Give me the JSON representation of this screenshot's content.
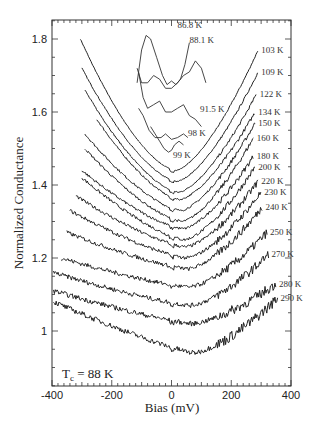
{
  "chart_data": {
    "type": "line",
    "title": "",
    "xlabel": "Bias (mV)",
    "ylabel": "Normalized Conductance",
    "xlim": [
      -400,
      400
    ],
    "ylim": [
      0.85,
      1.85
    ],
    "xticks": [
      -400,
      -200,
      0,
      200,
      400
    ],
    "xtick_labels": [
      "-400",
      "-200",
      "0",
      "200",
      "400"
    ],
    "yticks": [
      1.0,
      1.2,
      1.4,
      1.6,
      1.8
    ],
    "ytick_labels": [
      "1",
      "1.2",
      "1.4",
      "1.6",
      "1.8"
    ],
    "grid": false,
    "annotation": {
      "prefix": "T",
      "subscript": "c",
      "suffix": " = 88 K"
    },
    "inset_series": [
      {
        "name": "86.8 K",
        "points": [
          [
            -115,
            1.68
          ],
          [
            -100,
            1.77
          ],
          [
            -85,
            1.81
          ],
          [
            -70,
            1.8
          ],
          [
            -50,
            1.75
          ],
          [
            -30,
            1.7
          ],
          [
            -15,
            1.675
          ],
          [
            0,
            1.685
          ],
          [
            15,
            1.675
          ],
          [
            30,
            1.69
          ],
          [
            45,
            1.73
          ],
          [
            60,
            1.79
          ]
        ]
      },
      {
        "name": "88.1 K",
        "points": [
          [
            -115,
            1.72
          ],
          [
            -100,
            1.68
          ],
          [
            -80,
            1.68
          ],
          [
            -60,
            1.7
          ],
          [
            -40,
            1.69
          ],
          [
            -20,
            1.665
          ],
          [
            0,
            1.665
          ],
          [
            20,
            1.68
          ],
          [
            40,
            1.7
          ],
          [
            60,
            1.71
          ],
          [
            80,
            1.74
          ],
          [
            100,
            1.72
          ],
          [
            115,
            1.68
          ]
        ]
      },
      {
        "name": "91.5 K",
        "points": [
          [
            -110,
            1.71
          ],
          [
            -95,
            1.64
          ],
          [
            -80,
            1.61
          ],
          [
            -60,
            1.62
          ],
          [
            -40,
            1.63
          ],
          [
            -20,
            1.6
          ],
          [
            0,
            1.6
          ],
          [
            20,
            1.61
          ],
          [
            40,
            1.62
          ],
          [
            60,
            1.59
          ],
          [
            80,
            1.58
          ],
          [
            100,
            1.56
          ]
        ]
      },
      {
        "name": "98 K",
        "points": [
          [
            -110,
            1.61
          ],
          [
            -95,
            1.59
          ],
          [
            -75,
            1.55
          ],
          [
            -55,
            1.53
          ],
          [
            -35,
            1.53
          ],
          [
            -20,
            1.54
          ],
          [
            0,
            1.525
          ],
          [
            20,
            1.53
          ],
          [
            40,
            1.54
          ],
          [
            55,
            1.53
          ]
        ]
      },
      {
        "name": "99 K",
        "points": [
          [
            -70,
            1.56
          ],
          [
            -55,
            1.54
          ],
          [
            -40,
            1.52
          ],
          [
            -25,
            1.5
          ],
          [
            -10,
            1.49
          ],
          [
            0,
            1.495
          ],
          [
            10,
            1.51
          ],
          [
            25,
            1.52
          ],
          [
            40,
            1.51
          ]
        ]
      }
    ],
    "series": [
      {
        "name": "103 K",
        "x_range": [
          -305,
          290
        ],
        "left": 1.8,
        "min": 1.44,
        "right": 1.77
      },
      {
        "name": "109 K",
        "x_range": [
          -300,
          290
        ],
        "left": 1.72,
        "min": 1.41,
        "right": 1.71
      },
      {
        "name": "122 K",
        "x_range": [
          -290,
          285
        ],
        "left": 1.66,
        "min": 1.38,
        "right": 1.65
      },
      {
        "name": "134 K",
        "x_range": [
          -250,
          280
        ],
        "left": 1.58,
        "min": 1.36,
        "right": 1.6
      },
      {
        "name": "150 K",
        "x_range": [
          -290,
          280
        ],
        "left": 1.54,
        "min": 1.33,
        "right": 1.57
      },
      {
        "name": "160 K",
        "x_range": [
          -290,
          275
        ],
        "left": 1.5,
        "min": 1.3,
        "right": 1.53
      },
      {
        "name": "180 K",
        "x_range": [
          -300,
          275
        ],
        "left": 1.44,
        "min": 1.28,
        "right": 1.48
      },
      {
        "name": "200 K",
        "x_range": [
          -300,
          280
        ],
        "left": 1.42,
        "min": 1.25,
        "right": 1.45
      },
      {
        "name": "220 K",
        "x_range": [
          -320,
          290
        ],
        "left": 1.37,
        "min": 1.23,
        "right": 1.41
      },
      {
        "name": "230 K",
        "x_range": [
          -340,
          300
        ],
        "left": 1.33,
        "min": 1.2,
        "right": 1.38
      },
      {
        "name": "240 K",
        "x_range": [
          -350,
          305
        ],
        "left": 1.27,
        "min": 1.17,
        "right": 1.34
      },
      {
        "name": "250 K",
        "x_range": [
          -370,
          320
        ],
        "left": 1.2,
        "min": 1.12,
        "right": 1.27
      },
      {
        "name": "270 K",
        "x_range": [
          -395,
          325
        ],
        "left": 1.16,
        "min": 1.07,
        "right": 1.21
      },
      {
        "name": "280 K",
        "x_range": [
          -395,
          350
        ],
        "left": 1.11,
        "min": 1.02,
        "right": 1.13
      },
      {
        "name": "290 K",
        "x_range": [
          -395,
          355
        ],
        "left": 1.08,
        "min": 0.94,
        "right": 1.09
      }
    ]
  }
}
